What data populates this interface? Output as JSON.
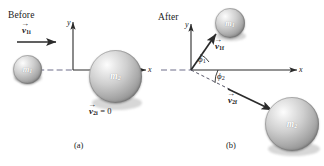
{
  "figure": {
    "stroke_color": "#2b2b2b",
    "dash_color": "#6f6f8a",
    "sphere_light": "#f2f2f2",
    "sphere_dark": "#8d8d8d"
  },
  "panel_a": {
    "state_label": "Before",
    "caption": "(a)",
    "axes": {
      "x_label": "x",
      "y_label": "y"
    },
    "vectors": [
      {
        "name": "v1i",
        "symbol": "v",
        "subscript": "1i",
        "value": "",
        "arrow": true
      }
    ],
    "rest_vector": {
      "symbol": "v",
      "subscript": "2i",
      "equals": "= 0"
    },
    "masses": [
      {
        "name": "m1",
        "symbol": "m",
        "subscript": "1"
      },
      {
        "name": "m2",
        "symbol": "m",
        "subscript": "2"
      }
    ]
  },
  "panel_b": {
    "state_label": "After",
    "caption": "(b)",
    "axes": {
      "x_label": "x",
      "y_label": "y"
    },
    "vectors": [
      {
        "name": "v1f",
        "symbol": "v",
        "subscript": "1f"
      },
      {
        "name": "v2f",
        "symbol": "v",
        "subscript": "2f"
      }
    ],
    "angles": [
      {
        "name": "phi1",
        "symbol": "ϕ",
        "subscript": "1"
      },
      {
        "name": "phi2",
        "symbol": "ϕ",
        "subscript": "2"
      }
    ],
    "masses": [
      {
        "name": "m1",
        "symbol": "m",
        "subscript": "1"
      },
      {
        "name": "m2",
        "symbol": "m",
        "subscript": "2"
      }
    ]
  }
}
